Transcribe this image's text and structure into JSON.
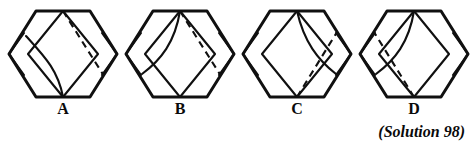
{
  "page": {
    "background_color": "#ffffff",
    "ink_color": "#101010",
    "kind": "puzzle-figure-row"
  },
  "caption": {
    "text": "(Solution 98)"
  },
  "figures": [
    {
      "id": "figure-a",
      "label": "A",
      "left": 4,
      "curve_side": "left-lower",
      "dash_from": "top-vertex",
      "dash_to": "right-lower",
      "small_diamond_sides": "both"
    },
    {
      "id": "figure-b",
      "label": "B",
      "left": 121,
      "curve_side": "left-upper",
      "dash_from": "top-vertex",
      "dash_to": "right-lower",
      "small_diamond_sides": "both"
    },
    {
      "id": "figure-c",
      "label": "C",
      "left": 238,
      "curve_side": "right-upper",
      "dash_from": "bottom-vertex",
      "dash_to": "right-upper",
      "small_diamond_sides": "both"
    },
    {
      "id": "figure-d",
      "label": "D",
      "left": 355,
      "curve_side": "left-upper-mirror",
      "dash_from": "bottom-vertex",
      "dash_to": "left-upper",
      "small_diamond_sides": "right"
    }
  ]
}
